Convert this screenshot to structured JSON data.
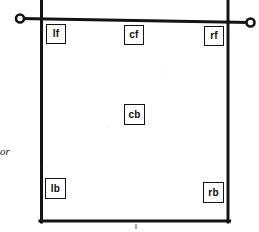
{
  "figure": {
    "ink_color": "#141414",
    "paper_color": "#ffffff",
    "side_note": {
      "text": "or",
      "style": "italic"
    },
    "rail": {
      "name": "head-rail",
      "left_ring_label": "",
      "right_ring_label": ""
    },
    "positions": [
      {
        "id": "lf",
        "label": "lf",
        "x": 46,
        "y": 24,
        "w": 20,
        "h": 20
      },
      {
        "id": "cf",
        "label": "cf",
        "x": 124,
        "y": 25,
        "w": 20,
        "h": 20
      },
      {
        "id": "rf",
        "label": "rf",
        "x": 204,
        "y": 26,
        "w": 20,
        "h": 20
      },
      {
        "id": "cb",
        "label": "cb",
        "x": 124,
        "y": 104,
        "w": 21,
        "h": 21
      },
      {
        "id": "lb",
        "label": "lb",
        "x": 45,
        "y": 178,
        "w": 21,
        "h": 21
      },
      {
        "id": "rb",
        "label": "rb",
        "x": 203,
        "y": 182,
        "w": 21,
        "h": 21
      }
    ]
  }
}
